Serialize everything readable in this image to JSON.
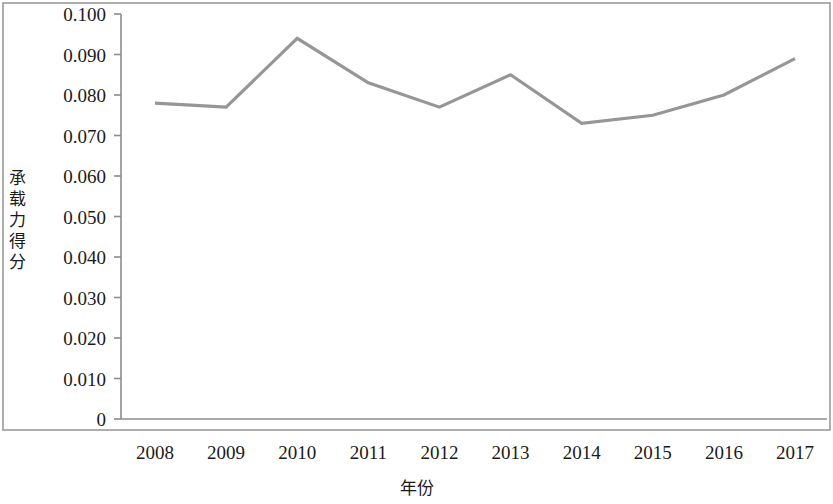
{
  "chart_data": {
    "type": "line",
    "title": "",
    "xlabel": "年份",
    "ylabel": "承载力得分",
    "categories": [
      "2008",
      "2009",
      "2010",
      "2011",
      "2012",
      "2013",
      "2014",
      "2015",
      "2016",
      "2017"
    ],
    "values": [
      0.078,
      0.077,
      0.094,
      0.083,
      0.077,
      0.085,
      0.073,
      0.075,
      0.08,
      0.089
    ],
    "series": [
      {
        "name": "承载力得分",
        "values": [
          0.078,
          0.077,
          0.094,
          0.083,
          0.077,
          0.085,
          0.073,
          0.075,
          0.08,
          0.089
        ],
        "color": "#969696"
      }
    ],
    "ylim": [
      0,
      0.1
    ],
    "yticks": [
      "0",
      "0.010",
      "0.020",
      "0.030",
      "0.040",
      "0.050",
      "0.060",
      "0.070",
      "0.080",
      "0.090",
      "0.100"
    ],
    "ytick_values": [
      0,
      0.01,
      0.02,
      0.03,
      0.04,
      0.05,
      0.06,
      0.07,
      0.08,
      0.09,
      0.1
    ],
    "grid": false,
    "legend": "none",
    "line_color": "#969696",
    "axis_color": "#8c8c8c",
    "frame_color": "#9a9a9a",
    "background": "#ffffff"
  },
  "axes": {
    "y_title_chars": "承\n载\n力\n得\n分",
    "x_title": "年份"
  }
}
